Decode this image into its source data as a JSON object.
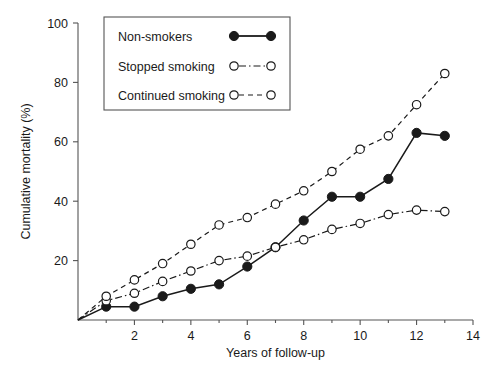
{
  "chart_data": {
    "type": "line",
    "title": "",
    "xlabel": "Years of follow-up",
    "ylabel": "Cumulative mortality (%)",
    "xlim": [
      0,
      14
    ],
    "ylim": [
      0,
      100
    ],
    "xticks": [
      0,
      2,
      4,
      6,
      8,
      10,
      12,
      14
    ],
    "xtick_labels": [
      "",
      "2",
      "4",
      "6",
      "8",
      "10",
      "12",
      "14"
    ],
    "xminorticks": [
      1,
      3,
      5,
      7,
      9,
      11,
      13
    ],
    "yticks": [
      0,
      20,
      40,
      60,
      80,
      100
    ],
    "ytick_labels": [
      "",
      "20",
      "40",
      "60",
      "80",
      "100"
    ],
    "grid": false,
    "legend_position": "top-left",
    "series": [
      {
        "name": "Non-smokers",
        "marker": "filled-circle",
        "linestyle": "solid",
        "color": "#1a1a1a",
        "x": [
          0,
          1,
          2,
          3,
          4,
          5,
          6,
          7,
          8,
          9,
          10,
          11,
          12,
          13
        ],
        "values": [
          0,
          4.5,
          4.5,
          8,
          10.5,
          12,
          18,
          24.5,
          33.5,
          41.5,
          41.5,
          47.5,
          63,
          62
        ]
      },
      {
        "name": "Stopped smoking",
        "marker": "open-circle",
        "linestyle": "dash-dot",
        "color": "#1a1a1a",
        "x": [
          0,
          1,
          2,
          3,
          4,
          5,
          6,
          7,
          8,
          9,
          10,
          11,
          12,
          13
        ],
        "values": [
          0,
          6.5,
          9,
          13,
          16.5,
          20,
          21.5,
          24.5,
          27,
          30.5,
          32.5,
          35.5,
          37,
          36.5
        ]
      },
      {
        "name": "Continued smoking",
        "marker": "open-circle",
        "linestyle": "dashed",
        "color": "#1a1a1a",
        "x": [
          0,
          1,
          2,
          3,
          4,
          5,
          6,
          7,
          8,
          9,
          10,
          11,
          12,
          13
        ],
        "values": [
          0,
          8,
          13.5,
          19,
          25.5,
          32,
          34.5,
          39,
          43.5,
          50,
          57.5,
          62,
          72.5,
          83
        ]
      }
    ]
  },
  "legend": {
    "entries": [
      {
        "label": "Non-smokers"
      },
      {
        "label": "Stopped smoking"
      },
      {
        "label": "Continued smoking"
      }
    ]
  },
  "axes": {
    "x_title": "Years of follow-up",
    "y_title": "Cumulative mortality (%)"
  }
}
